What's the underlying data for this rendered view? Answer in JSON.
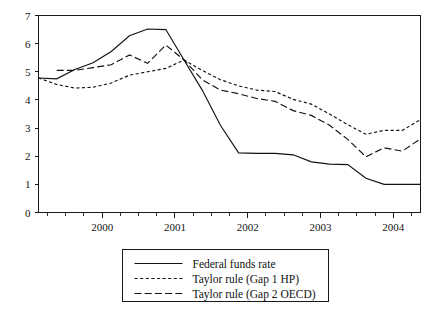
{
  "chart_data": {
    "type": "line",
    "title": "",
    "subtitle": "",
    "xlabel": "",
    "ylabel": "",
    "xlim": [
      1999.125,
      2004.375
    ],
    "ylim": [
      0,
      7
    ],
    "grid": false,
    "legend_position": "bottom-center",
    "y_ticks": [
      "0",
      "1",
      "2",
      "3",
      "4",
      "5",
      "6",
      "7"
    ],
    "y_tick_values": [
      0,
      1,
      2,
      3,
      4,
      5,
      6,
      7
    ],
    "x_ticks": [
      "2000",
      "2001",
      "2002",
      "2003",
      "2004"
    ],
    "x_tick_values": [
      2000,
      2001,
      2002,
      2003,
      2004
    ],
    "x_minor_interval": 0.25,
    "series": [
      {
        "name": "Federal funds rate",
        "style": "solid",
        "x": [
          1999.125,
          1999.375,
          1999.625,
          1999.875,
          2000.125,
          2000.375,
          2000.625,
          2000.875,
          2001.125,
          2001.375,
          2001.625,
          2001.875,
          2002.125,
          2002.375,
          2002.625,
          2002.875,
          2003.125,
          2003.375,
          2003.625,
          2003.875,
          2004.125,
          2004.375
        ],
        "values": [
          4.78,
          4.75,
          5.08,
          5.32,
          5.72,
          6.28,
          6.52,
          6.5,
          5.42,
          4.35,
          3.1,
          2.12,
          2.1,
          2.1,
          2.05,
          1.8,
          1.72,
          1.7,
          1.22,
          1.0,
          1.0,
          1.0
        ]
      },
      {
        "name": "Taylor rule (Gap 1 HP)",
        "style": "dotted",
        "x": [
          1999.125,
          1999.375,
          1999.625,
          1999.875,
          2000.125,
          2000.375,
          2000.625,
          2000.875,
          2001.125,
          2001.375,
          2001.625,
          2001.875,
          2002.125,
          2002.375,
          2002.625,
          2002.875,
          2003.125,
          2003.375,
          2003.625,
          2003.875,
          2004.125,
          2004.375
        ],
        "values": [
          4.78,
          4.55,
          4.42,
          4.45,
          4.6,
          4.88,
          5.0,
          5.12,
          5.42,
          5.05,
          4.72,
          4.5,
          4.35,
          4.3,
          4.02,
          3.85,
          3.5,
          3.12,
          2.78,
          2.92,
          2.92,
          3.3
        ]
      },
      {
        "name": "Taylor rule (Gap 2 OECD)",
        "style": "dashed",
        "x": [
          1999.375,
          1999.625,
          1999.875,
          2000.125,
          2000.375,
          2000.625,
          2000.875,
          2001.125,
          2001.375,
          2001.625,
          2001.875,
          2002.125,
          2002.375,
          2002.625,
          2002.875,
          2003.125,
          2003.375,
          2003.625,
          2003.875,
          2004.125,
          2004.375
        ],
        "values": [
          5.05,
          5.05,
          5.15,
          5.25,
          5.6,
          5.3,
          5.95,
          5.42,
          4.72,
          4.35,
          4.22,
          4.05,
          3.95,
          3.62,
          3.45,
          3.1,
          2.6,
          1.98,
          2.3,
          2.18,
          2.62
        ]
      }
    ],
    "legend": [
      {
        "label": "Federal funds rate",
        "style": "solid"
      },
      {
        "label": "Taylor rule (Gap 1 HP)",
        "style": "dotted"
      },
      {
        "label": "Taylor rule (Gap 2 OECD)",
        "style": "dashed"
      }
    ]
  },
  "colors": {
    "ink": "#111111",
    "axis": "#1a1a1a",
    "background": "#ffffff"
  }
}
